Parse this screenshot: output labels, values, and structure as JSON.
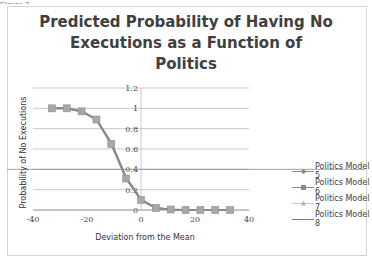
{
  "chart_data": {
    "type": "line",
    "title": "Predicted Probability of Having No Executions as a Function of Politics",
    "title_lines": [
      "Predicted Probability of Having No",
      "Executions as a Function of",
      "Politics"
    ],
    "xlabel": "Deviation from the Mean",
    "ylabel": "Probability of No Executions",
    "xlim": [
      -40,
      40
    ],
    "ylim": [
      0,
      1.2
    ],
    "x_ticks": [
      "-40",
      "-20",
      "0",
      "20",
      "40"
    ],
    "y_ticks": [
      "0",
      "0.2",
      "0.4",
      "0.6",
      "0.8",
      "1",
      "1.2"
    ],
    "grid": "horizontal",
    "legend_position": "right",
    "x": [
      -33,
      -27.5,
      -22,
      -16.5,
      -11,
      -5.5,
      0,
      5.5,
      11,
      16.5,
      22,
      27.5,
      33
    ],
    "series": [
      {
        "name": "Politics Model 5",
        "color": "#8c8c8c",
        "marker": "diamond",
        "values": [
          1.0,
          1.0,
          0.97,
          0.89,
          0.66,
          0.32,
          0.1,
          0.02,
          0.005,
          0.0,
          0.0,
          0.0,
          0.0
        ]
      },
      {
        "name": "Politics Model 6",
        "color": "#8a8a8a",
        "marker": "square",
        "values": [
          1.0,
          1.0,
          0.97,
          0.89,
          0.65,
          0.31,
          0.1,
          0.02,
          0.005,
          0.0,
          0.0,
          0.0,
          0.0
        ]
      },
      {
        "name": "Politics Model 7",
        "color": "#b5b5b5",
        "marker": "triangle",
        "values": [
          1.0,
          1.0,
          0.97,
          0.89,
          0.65,
          0.32,
          0.1,
          0.02,
          0.005,
          0.0,
          0.0,
          0.0,
          0.0
        ]
      },
      {
        "name": "Politics Model 8",
        "color": "#7a7a7a",
        "marker": "x",
        "values": [
          1.0,
          1.0,
          0.97,
          0.89,
          0.66,
          0.32,
          0.1,
          0.02,
          0.005,
          0.0,
          0.0,
          0.0,
          0.0
        ]
      }
    ]
  },
  "page": {
    "caption_fragment": "Figure 3"
  }
}
